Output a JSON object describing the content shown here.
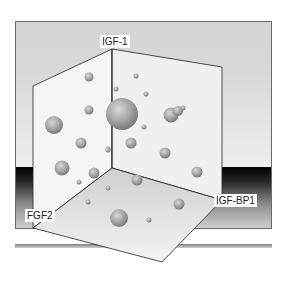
{
  "figure": {
    "axes": {
      "vertical": "IGF-1",
      "left": "FGF2",
      "right": "IGF-BP1"
    },
    "colors": {
      "background_top": "#d6d6d6",
      "background_dark_band": "#000000",
      "panel_fill": "#f4f4f4",
      "floor_fill": "#dcdcdc",
      "edge": "#222222",
      "sphere": "#a0a0a0"
    }
  }
}
